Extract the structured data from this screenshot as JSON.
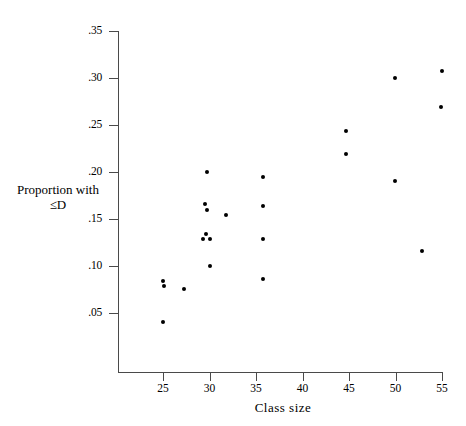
{
  "chart_data": {
    "type": "scatter",
    "title": "",
    "xlabel": "Class  size",
    "ylabel": "Proportion with ≤D",
    "xlim": [
      21.5,
      56.5
    ],
    "ylim": [
      0.0,
      0.35
    ],
    "grid": false,
    "legend": null,
    "xticks": [
      25,
      30,
      35,
      40,
      45,
      50,
      55
    ],
    "xtick_labels": [
      "25",
      "30",
      "35",
      "40",
      "45",
      "50",
      "55"
    ],
    "yticks": [
      0.05,
      0.1,
      0.15,
      0.2,
      0.25,
      0.3,
      0.35
    ],
    "ytick_labels": [
      ".05",
      ".10",
      ".15",
      ".20",
      ".25",
      ".30",
      ".35"
    ],
    "marker": "filled-circle",
    "marker_color": "#000000",
    "points": [
      {
        "x": 25.0,
        "y": 0.0845
      },
      {
        "x": 25.1,
        "y": 0.079
      },
      {
        "x": 25.0,
        "y": 0.04
      },
      {
        "x": 27.3,
        "y": 0.076
      },
      {
        "x": 29.5,
        "y": 0.1655
      },
      {
        "x": 29.7,
        "y": 0.16
      },
      {
        "x": 29.7,
        "y": 0.2005
      },
      {
        "x": 29.6,
        "y": 0.134
      },
      {
        "x": 29.3,
        "y": 0.1285
      },
      {
        "x": 30.0,
        "y": 0.1285
      },
      {
        "x": 30.0,
        "y": 0.1
      },
      {
        "x": 31.8,
        "y": 0.154
      },
      {
        "x": 35.8,
        "y": 0.1945
      },
      {
        "x": 35.8,
        "y": 0.164
      },
      {
        "x": 35.8,
        "y": 0.1285
      },
      {
        "x": 35.8,
        "y": 0.086
      },
      {
        "x": 44.7,
        "y": 0.2437
      },
      {
        "x": 44.7,
        "y": 0.2187
      },
      {
        "x": 49.9,
        "y": 0.2996
      },
      {
        "x": 49.9,
        "y": 0.1905
      },
      {
        "x": 52.9,
        "y": 0.1163
      },
      {
        "x": 55.0,
        "y": 0.3075
      },
      {
        "x": 54.9,
        "y": 0.269
      }
    ]
  }
}
